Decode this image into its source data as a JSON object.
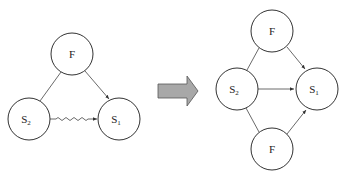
{
  "diagram": {
    "left": {
      "nodes": [
        {
          "id": "F",
          "label": "F",
          "sub": "",
          "cx": 72,
          "cy": 54
        },
        {
          "id": "S2",
          "label": "S",
          "sub": "2",
          "cx": 29,
          "cy": 119
        },
        {
          "id": "S1",
          "label": "S",
          "sub": "1",
          "cx": 119,
          "cy": 119
        }
      ],
      "edges": [
        {
          "from": "F",
          "to": "S2",
          "style": "line"
        },
        {
          "from": "F",
          "to": "S1",
          "style": "arrow"
        },
        {
          "from": "S2",
          "to": "S1",
          "style": "wavy-arrow"
        }
      ]
    },
    "transform_arrow": {
      "color": "#a8a8a8",
      "stroke": "#555555"
    },
    "right": {
      "nodes": [
        {
          "id": "F_top",
          "label": "F",
          "sub": "",
          "cx": 272,
          "cy": 31
        },
        {
          "id": "S2",
          "label": "S",
          "sub": "2",
          "cx": 237,
          "cy": 89
        },
        {
          "id": "S1",
          "label": "S",
          "sub": "1",
          "cx": 317,
          "cy": 89
        },
        {
          "id": "F_bottom",
          "label": "F",
          "sub": "",
          "cx": 272,
          "cy": 149
        }
      ],
      "edges": [
        {
          "from": "F_top",
          "to": "S2",
          "style": "line"
        },
        {
          "from": "F_top",
          "to": "S1",
          "style": "arrow"
        },
        {
          "from": "S2",
          "to": "S1",
          "style": "arrow"
        },
        {
          "from": "S2",
          "to": "F_bottom",
          "style": "line"
        },
        {
          "from": "F_bottom",
          "to": "S1",
          "style": "arrow"
        }
      ]
    }
  }
}
